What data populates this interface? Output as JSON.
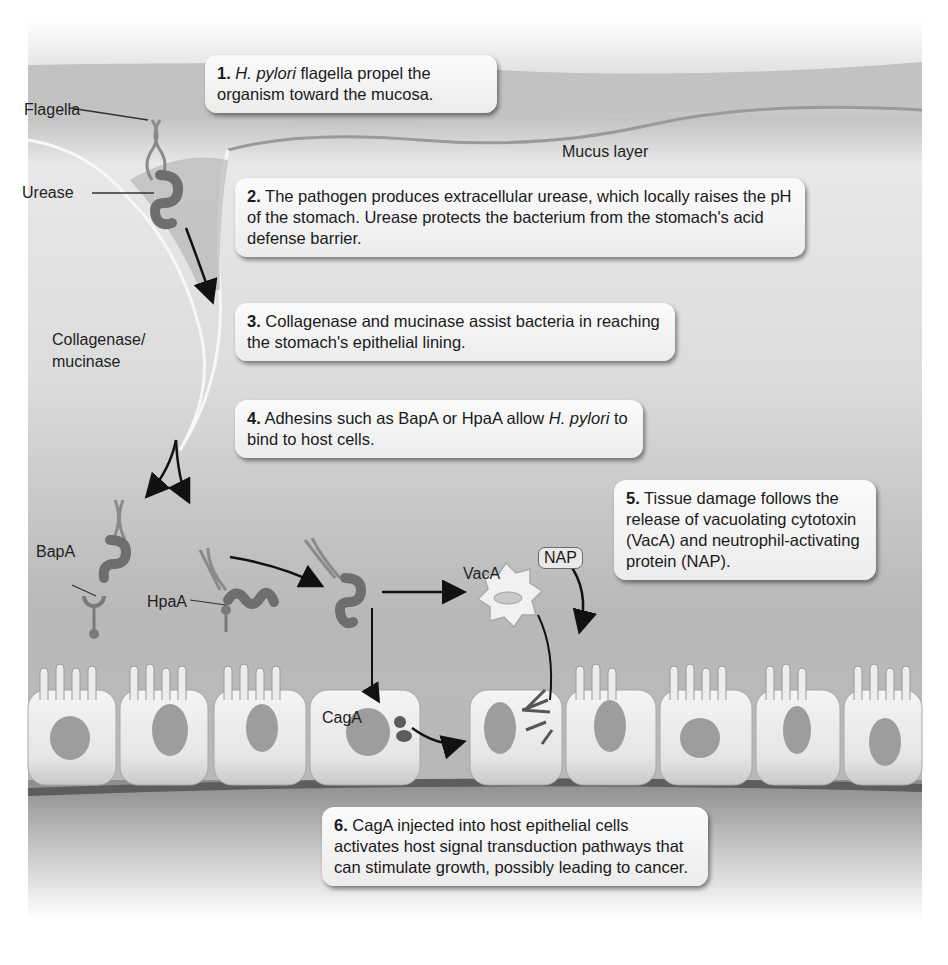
{
  "figure": {
    "callouts": [
      {
        "number": "1.",
        "italic": "H. pylori",
        "text": " flagella propel the organism toward the mucosa."
      },
      {
        "number": "2.",
        "text": " The pathogen produces extracellular urease, which locally raises the pH of the stomach. Urease protects the bacterium from the stomach's acid defense barrier."
      },
      {
        "number": "3.",
        "text": " Collagenase and mucinase assist bacteria in reaching the stomach's epithelial lining."
      },
      {
        "number": "4.",
        "text_before": " Adhesins such as BapA or HpaA allow ",
        "italic": "H. pylori",
        "text_after": " to bind to host cells."
      },
      {
        "number": "5.",
        "text": " Tissue damage follows the release of vacuolating cytotoxin (VacA) and neutrophil-activating protein (NAP)."
      },
      {
        "number": "6.",
        "text": " CagA injected into host epithelial cells activates host signal transduction pathways that can stimulate growth, possibly leading to cancer."
      }
    ],
    "labels": {
      "flagella": "Flagella",
      "urease": "Urease",
      "mucus_layer": "Mucus layer",
      "collagenase_line1": "Collagenase/",
      "collagenase_line2": "mucinase",
      "bapa": "BapA",
      "hpaa": "HpaA",
      "vaca": "VacA",
      "nap": "NAP",
      "caga": "CagA"
    },
    "colors": {
      "lumen_top": "#c9c9c9",
      "mucus": "#e6e6e6",
      "mucus_deep": "#bdbdbd",
      "cell": "#eeeeee",
      "nucleus": "#9d9d9d",
      "bacterium": "#6e6e6e",
      "basement": "#6b6b6b"
    }
  }
}
